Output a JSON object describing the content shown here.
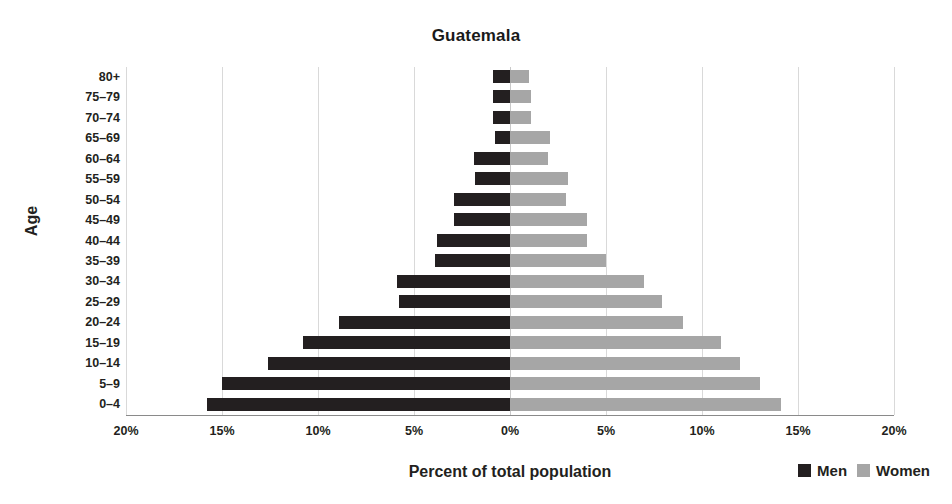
{
  "chart_data": {
    "type": "bar",
    "subtype": "population-pyramid",
    "title": "Guatemala",
    "xlabel": "Percent of total population",
    "ylabel": "Age",
    "categories": [
      "0–4",
      "5–9",
      "10–14",
      "15–19",
      "20–24",
      "25–29",
      "30–34",
      "35–39",
      "40–44",
      "45–49",
      "50–54",
      "55–59",
      "60–64",
      "65–69",
      "70–74",
      "75–79",
      "80+"
    ],
    "series": [
      {
        "name": "Men",
        "color": "#231f20",
        "side": "left",
        "values": [
          15.8,
          15.0,
          12.6,
          10.8,
          8.9,
          5.8,
          5.9,
          3.9,
          3.8,
          2.9,
          2.9,
          1.8,
          1.9,
          0.8,
          0.9,
          0.9,
          0.9
        ]
      },
      {
        "name": "Women",
        "color": "#a6a6a6",
        "side": "right",
        "values": [
          14.1,
          13.0,
          12.0,
          11.0,
          9.0,
          7.9,
          7.0,
          5.0,
          4.0,
          4.0,
          2.9,
          3.0,
          2.0,
          2.1,
          1.1,
          1.1,
          1.0
        ]
      }
    ],
    "xticks": [
      "20%",
      "15%",
      "10%",
      "5%",
      "0%",
      "5%",
      "10%",
      "15%",
      "20%"
    ],
    "xtick_values": [
      20,
      15,
      10,
      5,
      0,
      5,
      10,
      15,
      20
    ],
    "xlim": [
      -20,
      20
    ],
    "grid": true,
    "legend_position": "bottom-right",
    "legend": [
      "Men",
      "Women"
    ]
  },
  "legend": {
    "men_label": "Men",
    "women_label": "Women"
  },
  "axes": {
    "x_title": "Percent of total population",
    "y_title": "Age"
  },
  "header": {
    "title": "Guatemala"
  }
}
